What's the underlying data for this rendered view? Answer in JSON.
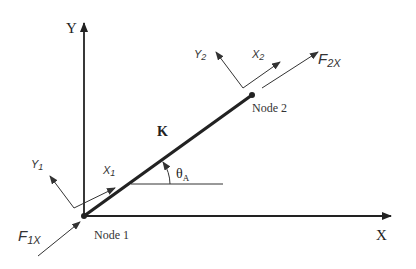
{
  "diagram": {
    "global_axes": {
      "x_label": "X",
      "y_label": "Y"
    },
    "element": {
      "stiffness_label": "K",
      "angle_symbol": "θ",
      "angle_subscript": "A"
    },
    "nodes": [
      {
        "label": "Node 1"
      },
      {
        "label": "Node 2"
      }
    ],
    "local_frames": [
      {
        "x_main": "X",
        "x_sub": "1",
        "y_main": "Y",
        "y_sub": "1"
      },
      {
        "x_main": "X",
        "x_sub": "2",
        "y_main": "Y",
        "y_sub": "2"
      }
    ],
    "forces": [
      {
        "main": "F",
        "sub": "1X"
      },
      {
        "main": "F",
        "sub": "2X"
      }
    ],
    "colors": {
      "line": "#222222",
      "thin_line": "#333333",
      "background": "#ffffff"
    }
  }
}
